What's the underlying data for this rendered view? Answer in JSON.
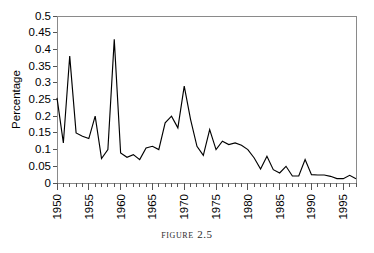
{
  "figure": {
    "caption": "Figure 2.5"
  },
  "chart_data": {
    "type": "line",
    "title": "",
    "xlabel": "",
    "ylabel": "Percentage",
    "xlim": [
      1950,
      1997
    ],
    "ylim": [
      0,
      0.5
    ],
    "grid": false,
    "legend": false,
    "legend_position": "none",
    "line_color": "#000000",
    "axis_color": "#8a8a8a",
    "y_ticks": [
      0,
      0.05,
      0.1,
      0.15,
      0.2,
      0.25,
      0.3,
      0.35,
      0.4,
      0.45,
      0.5
    ],
    "y_tick_labels": [
      "0",
      "0.05",
      "0.1",
      "0.15",
      "0.2",
      "0.25",
      "0.3",
      "0.35",
      "0.4",
      "0.45",
      "0.5"
    ],
    "x_ticks": [
      1950,
      1955,
      1960,
      1965,
      1970,
      1975,
      1980,
      1985,
      1990,
      1995
    ],
    "x_tick_labels": [
      "1950",
      "1955",
      "1960",
      "1965",
      "1970",
      "1975",
      "1980",
      "1985",
      "1990",
      "1995"
    ],
    "x": [
      1950,
      1951,
      1952,
      1953,
      1954,
      1955,
      1956,
      1957,
      1958,
      1959,
      1960,
      1961,
      1962,
      1963,
      1964,
      1965,
      1966,
      1967,
      1968,
      1969,
      1970,
      1971,
      1972,
      1973,
      1974,
      1975,
      1976,
      1977,
      1978,
      1979,
      1980,
      1981,
      1982,
      1983,
      1984,
      1985,
      1986,
      1987,
      1988,
      1989,
      1990,
      1991,
      1992,
      1993,
      1994,
      1995,
      1996,
      1997
    ],
    "values": [
      0.255,
      0.12,
      0.38,
      0.15,
      0.14,
      0.133,
      0.2,
      0.073,
      0.1,
      0.43,
      0.09,
      0.077,
      0.085,
      0.07,
      0.105,
      0.11,
      0.1,
      0.18,
      0.2,
      0.165,
      0.29,
      0.19,
      0.11,
      0.083,
      0.16,
      0.1,
      0.125,
      0.115,
      0.12,
      0.113,
      0.1,
      0.075,
      0.042,
      0.08,
      0.04,
      0.03,
      0.05,
      0.021,
      0.021,
      0.07,
      0.025,
      0.024,
      0.024,
      0.02,
      0.013,
      0.013,
      0.023,
      0.013
    ]
  }
}
